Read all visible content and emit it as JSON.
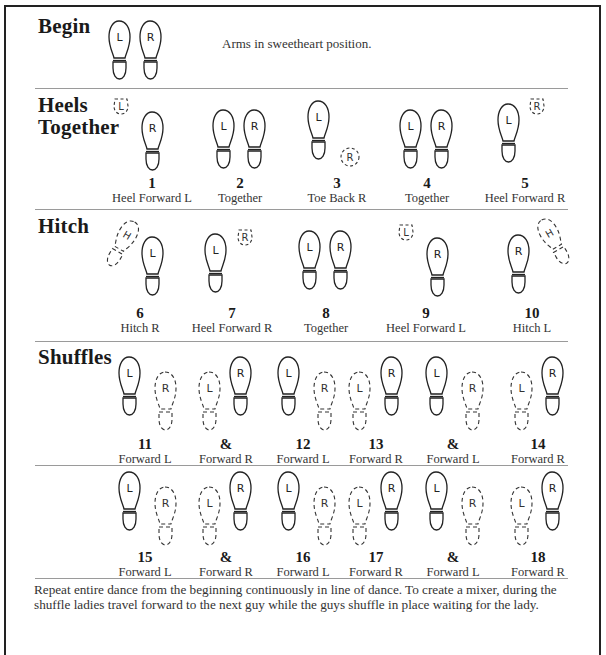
{
  "document": {
    "sections": [
      {
        "title_lines": [
          "Begin"
        ],
        "note": "Arms in sweetheart position."
      },
      {
        "title_lines": [
          "Heels",
          "Together"
        ]
      },
      {
        "title_lines": [
          "Hitch"
        ]
      },
      {
        "title_lines": [
          "Shuffles"
        ]
      }
    ],
    "steps": {
      "heels": [
        {
          "num": "1",
          "label": "Heel Forward L"
        },
        {
          "num": "2",
          "label": "Together"
        },
        {
          "num": "3",
          "label": "Toe Back R"
        },
        {
          "num": "4",
          "label": "Together"
        },
        {
          "num": "5",
          "label": "Heel Forward R"
        }
      ],
      "hitch": [
        {
          "num": "6",
          "label": "Hitch R"
        },
        {
          "num": "7",
          "label": "Heel Forward R"
        },
        {
          "num": "8",
          "label": "Together"
        },
        {
          "num": "9",
          "label": "Heel Forward L"
        },
        {
          "num": "10",
          "label": "Hitch L"
        }
      ],
      "shuffles1": [
        {
          "num": "11",
          "label": "Forward L"
        },
        {
          "num": "&",
          "label": "Forward R"
        },
        {
          "num": "12",
          "label": "Forward L"
        },
        {
          "num": "13",
          "label": "Forward R"
        },
        {
          "num": "&",
          "label": "Forward L"
        },
        {
          "num": "14",
          "label": "Forward R"
        }
      ],
      "shuffles2": [
        {
          "num": "15",
          "label": "Forward L"
        },
        {
          "num": "&",
          "label": "Forward R"
        },
        {
          "num": "16",
          "label": "Forward L"
        },
        {
          "num": "17",
          "label": "Forward R"
        },
        {
          "num": "&",
          "label": "Forward L"
        },
        {
          "num": "18",
          "label": "Forward R"
        }
      ]
    },
    "foot_letters": {
      "left": "L",
      "right": "R",
      "hitch": "H"
    },
    "footer": "Repeat entire dance from the beginning continuously in line of dance.  To create a mixer, during the shuffle ladies travel forward to the next guy while the guys shuffle in place waiting for the lady."
  }
}
